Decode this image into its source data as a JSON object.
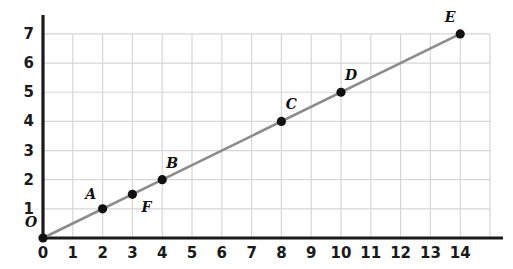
{
  "chart_data": {
    "type": "line",
    "title": "",
    "subtitle": "",
    "xlabel": "",
    "ylabel": "",
    "xlim": [
      0,
      14
    ],
    "ylim": [
      0,
      7
    ],
    "grid": true,
    "legend": false,
    "legend_position": "none",
    "x_ticks": [
      0,
      1,
      2,
      3,
      4,
      5,
      6,
      7,
      8,
      9,
      10,
      11,
      12,
      13,
      14
    ],
    "x_tick_labels": [
      "0",
      "1",
      "2",
      "3",
      "4",
      "5",
      "6",
      "7",
      "8",
      "9",
      "10",
      "11",
      "12",
      "13",
      "14"
    ],
    "y_ticks": [
      0,
      1,
      2,
      3,
      4,
      5,
      6,
      7
    ],
    "y_tick_labels": [
      "0",
      "1",
      "2",
      "3",
      "4",
      "5",
      "6",
      "7"
    ],
    "series": [
      {
        "name": "line-through-origin",
        "slope": 0.5,
        "intercept": 0,
        "x": [
          0,
          14
        ],
        "y": [
          0,
          7
        ],
        "color": "#8c8c8c"
      }
    ],
    "points": [
      {
        "label": "O",
        "x": 0,
        "y": 0,
        "label_dx": -12,
        "label_dy": -16,
        "marker": "filled-circle"
      },
      {
        "label": "A",
        "x": 2,
        "y": 1,
        "label_dx": -12,
        "label_dy": -15,
        "marker": "filled-circle"
      },
      {
        "label": "F",
        "x": 3,
        "y": 1.5,
        "label_dx": 14,
        "label_dy": 13,
        "marker": "filled-circle"
      },
      {
        "label": "B",
        "x": 4,
        "y": 2,
        "label_dx": 10,
        "label_dy": -17,
        "marker": "filled-circle"
      },
      {
        "label": "C",
        "x": 8,
        "y": 4,
        "label_dx": 10,
        "label_dy": -17,
        "marker": "filled-circle"
      },
      {
        "label": "D",
        "x": 10,
        "y": 5,
        "label_dx": 10,
        "label_dy": -17,
        "marker": "filled-circle"
      },
      {
        "label": "E",
        "x": 14,
        "y": 7,
        "label_dx": -10,
        "label_dy": -17,
        "marker": "filled-circle"
      }
    ],
    "colors": {
      "axis": "#1a1a1a",
      "grid": "#d6d6d6",
      "line": "#8c8c8c",
      "marker": "#111111",
      "background": "#ffffff",
      "text": "#1a1a1a"
    }
  }
}
